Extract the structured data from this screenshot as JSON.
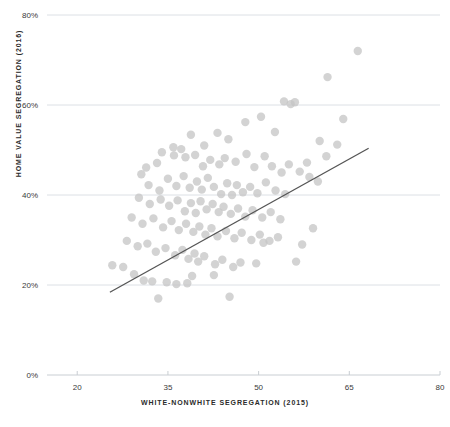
{
  "chart_data": {
    "type": "scatter",
    "title": "",
    "xlabel": "WHITE-NONWHITE SEGREGATION (2015)",
    "ylabel": "HOME VALUE SEGREGATION (2016)",
    "xlim": [
      15,
      80
    ],
    "ylim": [
      0,
      85
    ],
    "xticks": [
      20,
      35,
      50,
      65,
      80
    ],
    "xtick_labels": [
      "20",
      "35",
      "50",
      "65",
      "80"
    ],
    "yticks": [
      0,
      20,
      40,
      60,
      80
    ],
    "ytick_labels": [
      "0%",
      "20%",
      "40%",
      "60%",
      "80%"
    ],
    "grid": true,
    "grid_axis": "y",
    "legend": false,
    "point_color": "#c4c4c4",
    "point_opacity": 0.75,
    "point_radius": 4.2,
    "grid_color": "#d8dde2",
    "axis_color": "#c9ced3",
    "trendline": {
      "color": "#555555",
      "x_start": 25.4,
      "y_start": 18.4,
      "x_end": 68.2,
      "y_end": 50.4
    },
    "points": [
      [
        66.4,
        72.0
      ],
      [
        61.4,
        66.2
      ],
      [
        64.0,
        56.9
      ],
      [
        54.2,
        60.8
      ],
      [
        56.0,
        60.6
      ],
      [
        55.3,
        60.2
      ],
      [
        63.0,
        51.2
      ],
      [
        60.1,
        52.0
      ],
      [
        61.2,
        48.6
      ],
      [
        58.0,
        47.2
      ],
      [
        52.7,
        54.0
      ],
      [
        50.4,
        57.4
      ],
      [
        47.8,
        56.2
      ],
      [
        45.0,
        52.4
      ],
      [
        43.2,
        53.8
      ],
      [
        41.0,
        51.0
      ],
      [
        38.8,
        53.4
      ],
      [
        37.2,
        50.2
      ],
      [
        35.9,
        50.6
      ],
      [
        34.0,
        49.5
      ],
      [
        33.2,
        47.1
      ],
      [
        31.4,
        46.1
      ],
      [
        30.6,
        44.6
      ],
      [
        36.0,
        48.8
      ],
      [
        37.9,
        48.4
      ],
      [
        39.5,
        48.9
      ],
      [
        40.8,
        46.4
      ],
      [
        42.0,
        47.8
      ],
      [
        43.5,
        46.8
      ],
      [
        44.4,
        48.2
      ],
      [
        46.2,
        47.4
      ],
      [
        48.0,
        49.1
      ],
      [
        49.3,
        46.2
      ],
      [
        51.0,
        48.6
      ],
      [
        52.2,
        46.4
      ],
      [
        53.8,
        45.0
      ],
      [
        55.0,
        46.8
      ],
      [
        56.8,
        45.2
      ],
      [
        58.4,
        44.0
      ],
      [
        59.8,
        43.0
      ],
      [
        31.8,
        42.2
      ],
      [
        33.6,
        41.0
      ],
      [
        35.0,
        43.6
      ],
      [
        36.4,
        42.0
      ],
      [
        37.6,
        44.2
      ],
      [
        38.6,
        41.6
      ],
      [
        39.8,
        43.0
      ],
      [
        40.6,
        41.2
      ],
      [
        41.6,
        43.8
      ],
      [
        42.6,
        41.8
      ],
      [
        43.8,
        40.2
      ],
      [
        44.8,
        42.6
      ],
      [
        45.6,
        40.0
      ],
      [
        46.4,
        42.2
      ],
      [
        47.4,
        40.6
      ],
      [
        48.6,
        41.8
      ],
      [
        49.8,
        40.4
      ],
      [
        51.2,
        42.8
      ],
      [
        52.8,
        41.0
      ],
      [
        54.4,
        40.2
      ],
      [
        30.2,
        39.4
      ],
      [
        32.0,
        38.0
      ],
      [
        33.8,
        39.0
      ],
      [
        35.2,
        37.6
      ],
      [
        36.6,
        38.8
      ],
      [
        37.8,
        36.4
      ],
      [
        38.8,
        38.2
      ],
      [
        39.6,
        36.0
      ],
      [
        40.4,
        38.6
      ],
      [
        41.4,
        36.8
      ],
      [
        42.4,
        38.0
      ],
      [
        43.4,
        36.2
      ],
      [
        44.2,
        37.4
      ],
      [
        45.4,
        35.8
      ],
      [
        46.6,
        37.0
      ],
      [
        47.8,
        35.2
      ],
      [
        49.0,
        36.6
      ],
      [
        50.6,
        35.0
      ],
      [
        52.0,
        36.2
      ],
      [
        53.6,
        34.6
      ],
      [
        29.0,
        35.0
      ],
      [
        30.8,
        33.6
      ],
      [
        32.6,
        34.8
      ],
      [
        34.2,
        32.8
      ],
      [
        35.6,
        34.2
      ],
      [
        36.8,
        32.2
      ],
      [
        38.0,
        33.6
      ],
      [
        39.2,
        31.8
      ],
      [
        40.2,
        33.0
      ],
      [
        41.2,
        31.2
      ],
      [
        42.2,
        32.6
      ],
      [
        43.2,
        30.8
      ],
      [
        44.6,
        32.0
      ],
      [
        46.0,
        30.4
      ],
      [
        47.2,
        31.6
      ],
      [
        48.8,
        30.0
      ],
      [
        50.2,
        31.2
      ],
      [
        51.8,
        29.8
      ],
      [
        53.2,
        30.6
      ],
      [
        28.2,
        29.8
      ],
      [
        30.0,
        28.6
      ],
      [
        31.6,
        29.2
      ],
      [
        33.0,
        27.4
      ],
      [
        34.6,
        28.2
      ],
      [
        36.2,
        26.6
      ],
      [
        37.4,
        27.8
      ],
      [
        38.4,
        25.8
      ],
      [
        39.4,
        27.0
      ],
      [
        40.0,
        25.2
      ],
      [
        41.0,
        26.4
      ],
      [
        42.8,
        24.6
      ],
      [
        44.0,
        25.6
      ],
      [
        45.8,
        24.0
      ],
      [
        47.0,
        25.0
      ],
      [
        25.8,
        24.4
      ],
      [
        27.6,
        24.0
      ],
      [
        29.4,
        22.4
      ],
      [
        31.0,
        21.0
      ],
      [
        32.4,
        20.8
      ],
      [
        34.8,
        20.6
      ],
      [
        36.4,
        20.2
      ],
      [
        38.2,
        20.4
      ],
      [
        39.0,
        22.0
      ],
      [
        42.6,
        22.2
      ],
      [
        33.4,
        17.0
      ],
      [
        45.2,
        17.4
      ],
      [
        49.6,
        24.8
      ],
      [
        56.2,
        25.2
      ],
      [
        57.2,
        29.0
      ],
      [
        59.0,
        32.6
      ],
      [
        50.8,
        29.4
      ]
    ]
  }
}
